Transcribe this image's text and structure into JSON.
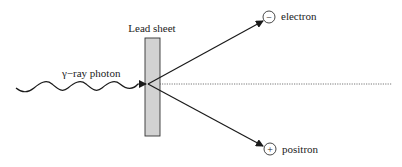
{
  "diagram": {
    "labels": {
      "lead_sheet": "Lead sheet",
      "photon": "γ−ray photon",
      "electron": "electron",
      "positron": "positron",
      "electron_sign": "−",
      "positron_sign": "+"
    },
    "colors": {
      "lead_fill": "#d2d2d2",
      "stroke": "#1a1a1a",
      "dotted": "#555555"
    }
  }
}
